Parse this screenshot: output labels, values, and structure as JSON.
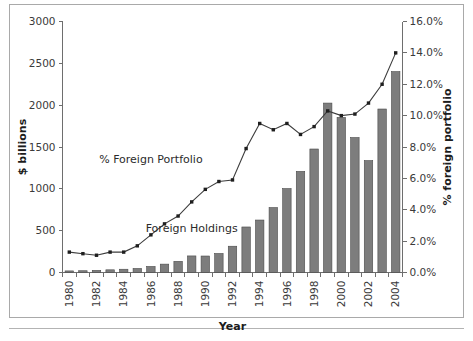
{
  "chart_data": {
    "type": "bar",
    "title": "",
    "xlabel": "Year",
    "ylabel": "$ billions",
    "y2label": "% foreign portfolio",
    "grid": false,
    "legend_position": "inline-annotations",
    "categories": [
      "1980",
      "1981",
      "1982",
      "1983",
      "1984",
      "1985",
      "1986",
      "1987",
      "1988",
      "1989",
      "1990",
      "1991",
      "1992",
      "1993",
      "1994",
      "1995",
      "1996",
      "1997",
      "1998",
      "1999",
      "2000",
      "2001",
      "2002",
      "2003",
      "2004"
    ],
    "x_tick_labels": [
      "1980",
      "",
      "1982",
      "",
      "1984",
      "",
      "1986",
      "",
      "1988",
      "",
      "1990",
      "",
      "1992",
      "",
      "1994",
      "",
      "1996",
      "",
      "1998",
      "",
      "2000",
      "",
      "2002",
      "",
      "2004"
    ],
    "ylim": [
      0,
      3000
    ],
    "y_ticks": [
      0,
      500,
      1000,
      1500,
      2000,
      2500,
      3000
    ],
    "y_tick_labels": [
      "0",
      "500",
      "1000",
      "1500",
      "2000",
      "2500",
      "3000"
    ],
    "y2lim": [
      0,
      16
    ],
    "y2_ticks": [
      0,
      2,
      4,
      6,
      8,
      10,
      12,
      14,
      16
    ],
    "y2_tick_labels": [
      "0.0%",
      "2.0%",
      "4.0%",
      "6.0%",
      "8.0%",
      "10.0%",
      "12.0%",
      "14.0%",
      "16.0%"
    ],
    "series": [
      {
        "name": "Foreign Holdings",
        "kind": "bar",
        "axis": "left",
        "unit": "$ billions",
        "color": "#7d7d7d",
        "values": [
          19,
          21,
          25,
          32,
          39,
          48,
          72,
          100,
          133,
          198,
          197,
          227,
          314,
          544,
          627,
          776,
          1003,
          1208,
          1476,
          2025,
          1853,
          1613,
          1337,
          1954,
          2401
        ]
      },
      {
        "name": "% Foreign Portfolio",
        "kind": "line",
        "axis": "right",
        "unit": "%",
        "color": "#3d3d3d",
        "values": [
          1.3,
          1.2,
          1.1,
          1.3,
          1.3,
          1.7,
          2.4,
          3.1,
          3.6,
          4.5,
          5.3,
          5.8,
          5.9,
          7.9,
          9.5,
          9.1,
          9.5,
          8.8,
          9.3,
          10.3,
          10.0,
          10.1,
          10.8,
          12.0,
          14.0
        ]
      }
    ],
    "annotations": [
      {
        "text": "% Foreign Portfolio",
        "x": "1986",
        "y": 7.0,
        "axis": "right"
      },
      {
        "text": "Foreign Holdings",
        "x": "1989",
        "y": 480,
        "axis": "left"
      }
    ]
  }
}
